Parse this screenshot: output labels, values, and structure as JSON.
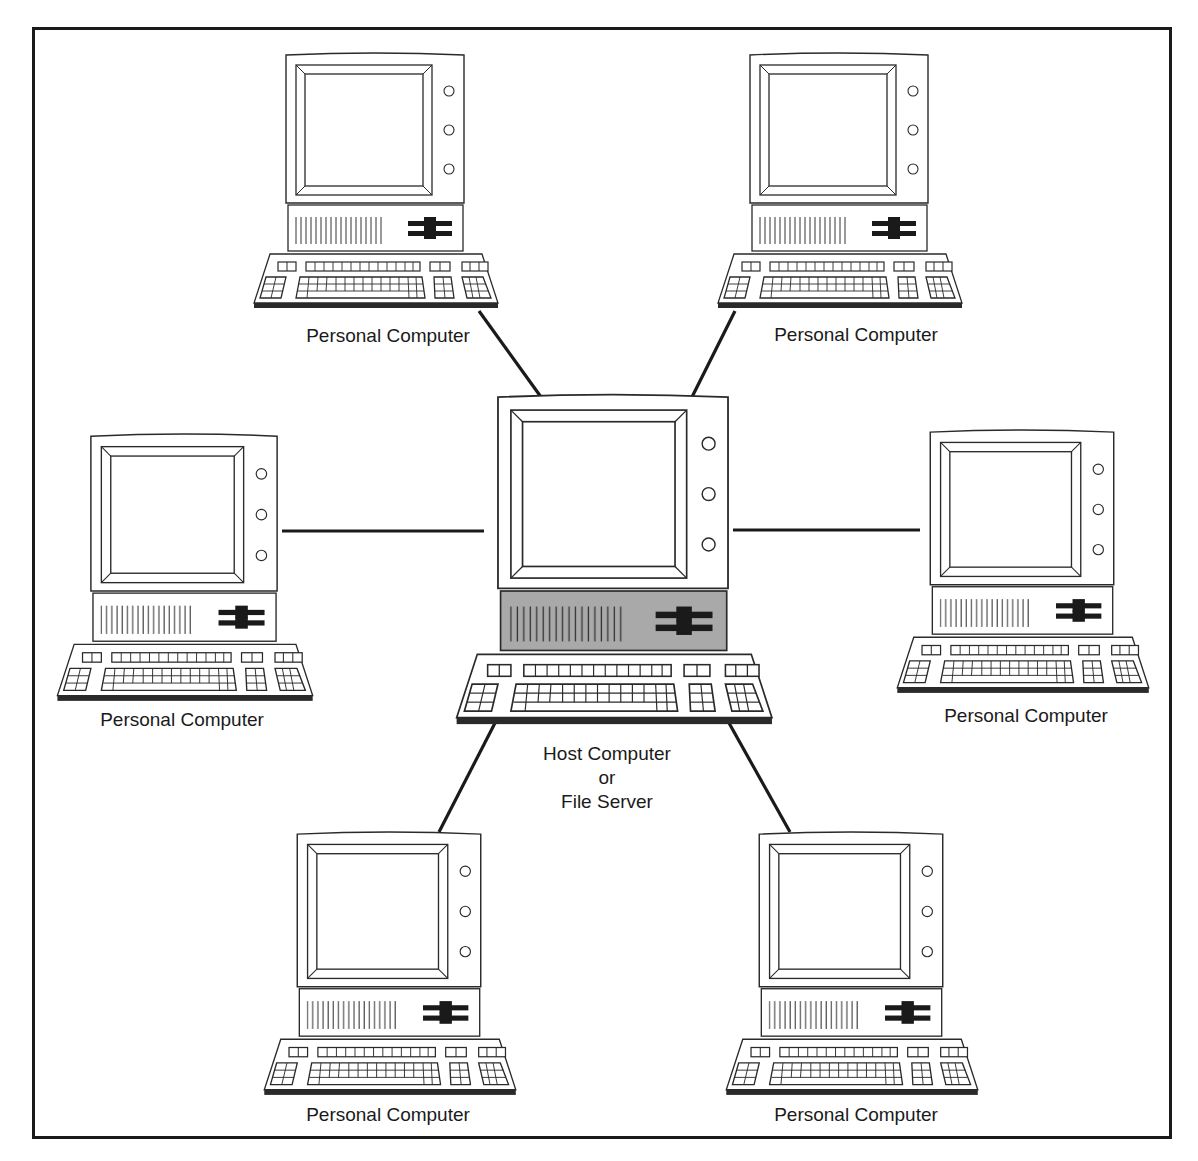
{
  "figure": {
    "type": "star-network-diagram",
    "colors": {
      "line": "#1a1a1a",
      "stroke": "#2a2a2a",
      "background": "#ffffff",
      "host_chassis": "#a9a9a9"
    }
  },
  "host": {
    "label_line1": "Host Computer",
    "label_line2": "or",
    "label_line3": "File Server",
    "icon": "desktop-computer-icon"
  },
  "clients": [
    {
      "id": "pc-top-left",
      "label": "Personal Computer",
      "icon": "desktop-computer-icon"
    },
    {
      "id": "pc-top-right",
      "label": "Personal Computer",
      "icon": "desktop-computer-icon"
    },
    {
      "id": "pc-left",
      "label": "Personal Computer",
      "icon": "desktop-computer-icon"
    },
    {
      "id": "pc-right",
      "label": "Personal Computer",
      "icon": "desktop-computer-icon"
    },
    {
      "id": "pc-bottom-left",
      "label": "Personal Computer",
      "icon": "desktop-computer-icon"
    },
    {
      "id": "pc-bottom-right",
      "label": "Personal Computer",
      "icon": "desktop-computer-icon"
    }
  ],
  "connections": [
    {
      "from": "host",
      "to": "pc-top-left"
    },
    {
      "from": "host",
      "to": "pc-top-right"
    },
    {
      "from": "host",
      "to": "pc-left"
    },
    {
      "from": "host",
      "to": "pc-right"
    },
    {
      "from": "host",
      "to": "pc-bottom-left"
    },
    {
      "from": "host",
      "to": "pc-bottom-right"
    }
  ]
}
